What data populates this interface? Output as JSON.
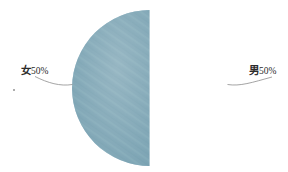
{
  "canvas": {
    "width": 288,
    "height": 172,
    "background": "#ffffff"
  },
  "chart_data": {
    "type": "pie",
    "title": "",
    "subtitle": "",
    "xlabel": "",
    "ylabel": "",
    "legend": "none",
    "grid": false,
    "categories": [
      "女",
      "男"
    ],
    "values": [
      50,
      50
    ],
    "units": "%",
    "slices": [
      {
        "category": "女",
        "value": 50,
        "percent_text": "50%",
        "label": "女50%",
        "color": "#b9d1de",
        "side": "left",
        "start_angle_deg": 180,
        "end_angle_deg": 360
      },
      {
        "category": "男",
        "value": 50,
        "percent_text": "50%",
        "label": "男50%",
        "color": "#7ba3b3",
        "side": "right",
        "start_angle_deg": 0,
        "end_angle_deg": 180
      }
    ],
    "geometry": {
      "center_x": 150,
      "center_y": 88,
      "radius": 78
    },
    "leader_line_color": "#8d8d8d"
  },
  "labels": {
    "female": {
      "category": "女",
      "percent": "50%"
    },
    "male": {
      "category": "男",
      "percent": "50%"
    }
  }
}
